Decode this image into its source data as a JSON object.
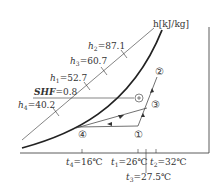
{
  "diagram": {
    "type": "psychrometric-chart",
    "enthalpy_axis_label": "h[kJ/kg]",
    "shf_label": "SHF=0.8",
    "enthalpy_values": [
      {
        "name": "h2",
        "value": "87.1"
      },
      {
        "name": "h3",
        "value": "60.7"
      },
      {
        "name": "h1",
        "value": "52.7"
      },
      {
        "name": "h4",
        "value": "40.2"
      }
    ],
    "temperatures": [
      {
        "name": "t4",
        "value": "16℃"
      },
      {
        "name": "t1",
        "value": "26℃"
      },
      {
        "name": "t3",
        "value": "27.5℃"
      },
      {
        "name": "t2",
        "value": "32℃"
      }
    ],
    "points": [
      "①",
      "②",
      "③",
      "④"
    ],
    "shf_marker": "⊕"
  },
  "labels": {
    "h_axis": "h[kJ/kg]",
    "h2": "=87.1",
    "h3": "=60.7",
    "h1": "=52.7",
    "h4": "=40.2",
    "shf_name": "SHF",
    "shf_value": "=0.8",
    "t4": "=16℃",
    "t1": "=26℃",
    "t3": "=27.5℃",
    "t2": "=32℃",
    "p1": "①",
    "p2": "②",
    "p3": "③",
    "p4": "④"
  }
}
